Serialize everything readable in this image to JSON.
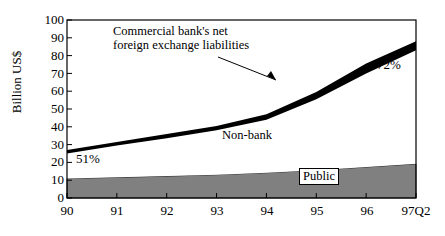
{
  "chart_data": {
    "type": "area",
    "title": "",
    "xlabel": "",
    "ylabel": "Billion US$",
    "ylim": [
      0,
      100
    ],
    "yticks": [
      0,
      10,
      20,
      30,
      40,
      50,
      60,
      70,
      80,
      90,
      100
    ],
    "categories": [
      "90",
      "91",
      "92",
      "93",
      "94",
      "95",
      "96",
      "97Q2"
    ],
    "x": [
      0,
      1,
      2,
      3,
      4,
      5,
      6,
      7
    ],
    "grid": false,
    "legend_position": "in-plot-annotations",
    "series": [
      {
        "name": "Public",
        "fill": "#808080",
        "values": [
          11,
          11.6,
          12.3,
          13.1,
          14.2,
          15.6,
          17.4,
          19.2
        ]
      },
      {
        "name": "Non-bank",
        "fill": "#ffffff",
        "values": [
          25,
          29.5,
          33.5,
          38,
          44,
          55.5,
          70,
          83
        ]
      },
      {
        "name": "Commercial bank's net foreign exchange liabilities",
        "fill": "#000000",
        "values": [
          27,
          31.5,
          36,
          40.5,
          47,
          59.5,
          75.5,
          88
        ]
      }
    ],
    "annotations": [
      {
        "id": "series-callout",
        "text_line1": "Commercial bank's net",
        "text_line2": "foreign exchange liabilities",
        "arrow": true
      },
      {
        "id": "nonbank-label",
        "text": "Non-bank"
      },
      {
        "id": "public-label",
        "text": "Public"
      },
      {
        "id": "left-percent",
        "text": "51%"
      },
      {
        "id": "right-percent",
        "text": "72%"
      }
    ]
  },
  "axes": {
    "y_label": "Billion US$",
    "y_ticks": [
      "100",
      "90",
      "80",
      "70",
      "60",
      "50",
      "40",
      "30",
      "20",
      "10",
      "0"
    ],
    "x_ticks": [
      "90",
      "91",
      "92",
      "93",
      "94",
      "95",
      "96",
      "97Q2"
    ]
  },
  "labels": {
    "callout_line1": "Commercial bank's net",
    "callout_line2": "foreign exchange liabilities",
    "nonbank": "Non-bank",
    "public": "Public",
    "left_percent": "51%",
    "right_percent": "72%"
  },
  "colors": {
    "public_area": "#808080",
    "bank_band": "#000000",
    "nonbank_area": "#ffffff",
    "axis": "#000000",
    "background": "#ffffff"
  }
}
